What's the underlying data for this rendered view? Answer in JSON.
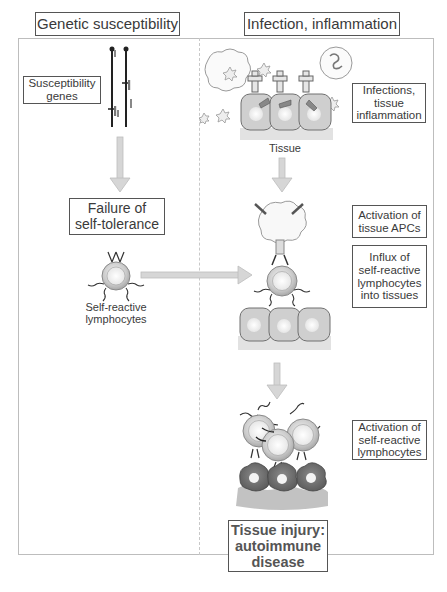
{
  "columns": {
    "left_header": "Genetic susceptibility",
    "right_header": "Infection, inflammation"
  },
  "left": {
    "susceptibility_genes": "Susceptibility genes",
    "failure_line1": "Failure of",
    "failure_line2": "self-tolerance",
    "lymphocyte_label_line1": "Self-reactive",
    "lymphocyte_label_line2": "lymphocytes"
  },
  "right": {
    "infections_line1": "Infections,",
    "infections_line2": "tissue",
    "infections_line3": "inflammation",
    "tissue_label": "Tissue",
    "apc_line1": "Activation of",
    "apc_line2": "tissue APCs",
    "influx_line1": "Influx of",
    "influx_line2": "self-reactive",
    "influx_line3": "lymphocytes",
    "influx_line4": "into tissues",
    "activation_line1": "Activation of",
    "activation_line2": "self-reactive",
    "activation_line3": "lymphocytes",
    "injury_line1": "Tissue injury:",
    "injury_line2": "autoimmune",
    "injury_line3": "disease"
  },
  "colors": {
    "arrow": "#c8c8c8",
    "cell_fill": "#cfcfcf",
    "cell_stroke": "#707070",
    "tissue_base": "#e2e2e2",
    "injured_cell": "#6e6e6e",
    "box_border": "#555555"
  }
}
